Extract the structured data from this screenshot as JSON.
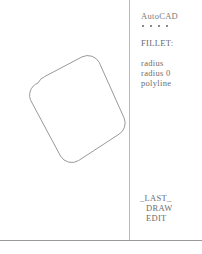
{
  "app": {
    "title": "AutoCAD",
    "separator_dots": [
      "*",
      "*",
      "*",
      "*"
    ]
  },
  "menu": {
    "command_label": "FILLET:",
    "options": [
      {
        "label": "radius"
      },
      {
        "label": "radius 0"
      },
      {
        "label": "polyline"
      }
    ],
    "footer_items": [
      {
        "label": "_LAST_"
      },
      {
        "label": "DRAW"
      },
      {
        "label": "EDIT"
      }
    ]
  },
  "drawing": {
    "shape_name": "filleted-polyline-square",
    "stroke_color": "#8d8d8d",
    "fill": "none",
    "rotation_degrees": 22,
    "fillet_radius": 13,
    "vertices": [
      {
        "x": 93,
        "y": 60
      },
      {
        "x": 125,
        "y": 131
      },
      {
        "x": 68,
        "y": 168
      },
      {
        "x": 30,
        "y": 97
      }
    ]
  },
  "canvas": {
    "background_color": "#ffffff",
    "divider_color": "#b9b9b9",
    "baseline_color": "#9a9a9a"
  }
}
